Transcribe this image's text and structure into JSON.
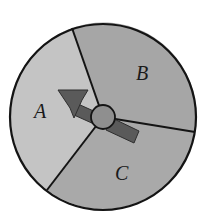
{
  "diagram": {
    "type": "spinner",
    "center": [
      103,
      117
    ],
    "radius": 93,
    "sectors": [
      {
        "label": "A",
        "color": "#c4c4c4"
      },
      {
        "label": "B",
        "color": "#a6a6a6"
      },
      {
        "label": "C",
        "color": "#a9a9a9"
      }
    ],
    "hub_color": "#8f8f8f",
    "arrow_color": "#5a5a5a",
    "outline_color": "#141414"
  }
}
